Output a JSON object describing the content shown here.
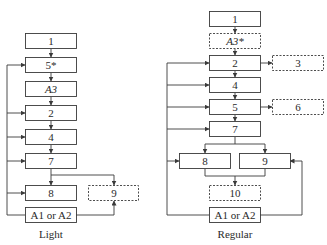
{
  "diagram": {
    "light": {
      "caption": "Light",
      "boxes": {
        "b1": "1",
        "b5s": "5*",
        "bA3": "A3",
        "b2": "2",
        "b4": "4",
        "b7": "7",
        "b8": "8",
        "b9": "9",
        "bA": "A1 or A2"
      },
      "optional_boxes": [
        "9"
      ]
    },
    "regular": {
      "caption": "Regular",
      "boxes": {
        "b1": "1",
        "bA3s": "A3*",
        "b2": "2",
        "b3": "3",
        "b4": "4",
        "b5": "5",
        "b6": "6",
        "b7": "7",
        "b8": "8",
        "b9": "9",
        "b10": "10",
        "bA": "A1 or A2"
      },
      "optional_boxes": [
        "A3*",
        "3",
        "6",
        "10"
      ]
    },
    "colors": {
      "line": "#3a3a3a",
      "text": "#2a2a2a",
      "background": "#ffffff"
    }
  }
}
